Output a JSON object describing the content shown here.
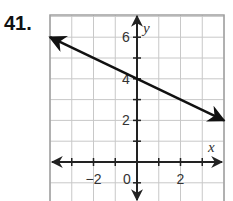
{
  "problem": {
    "number": "41."
  },
  "chart_data": {
    "type": "line",
    "title": "",
    "xlabel": "x",
    "ylabel": "y",
    "xlim": [
      -4,
      4
    ],
    "ylim": [
      -1.9,
      7
    ],
    "grid": true,
    "x_tick_labels": [
      {
        "value": -2,
        "label": "−2"
      },
      {
        "value": 0,
        "label": "0"
      },
      {
        "value": 2,
        "label": "2"
      }
    ],
    "y_tick_labels": [
      {
        "value": 2,
        "label": "2"
      },
      {
        "value": 4,
        "label": "4"
      },
      {
        "value": 6,
        "label": "6"
      }
    ],
    "series": [
      {
        "name": "line",
        "x": [
          -4,
          0,
          4
        ],
        "y": [
          6,
          4,
          2
        ],
        "slope": -0.5,
        "y_intercept": 4,
        "arrows_both_ends": true
      }
    ],
    "colors": {
      "line": "#111111",
      "grid": "#c8c8c8",
      "axis": "#222222",
      "frame": "#a0a0a0"
    }
  }
}
